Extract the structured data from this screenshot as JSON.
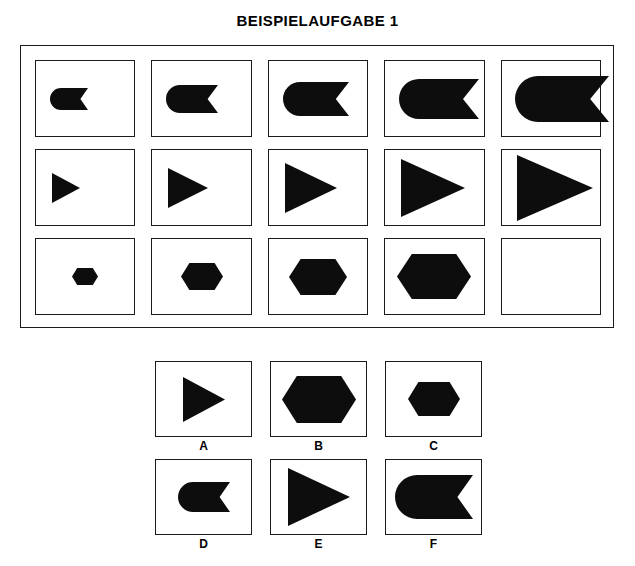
{
  "title": "BEISPIELAUFGABE 1",
  "colors": {
    "shape_fill": "#0d0d0d",
    "border": "#1a1a1a",
    "background": "#ffffff"
  },
  "chart_data": {
    "type": "table",
    "title": "BEISPIELAUFGABE 1",
    "grid": {
      "rows": 3,
      "columns": 5
    },
    "rules": [
      "Row 1: flag shape (rounded left end, V-notch on right), size increases left to right",
      "Row 2: right-pointing triangle, size increases left to right",
      "Row 3: horizontal hexagon, size increases left to right; column 5 is missing"
    ],
    "cells": [
      {
        "row": 1,
        "col": 1,
        "shape": "flag",
        "size_step": 1,
        "width": 38,
        "height": 22,
        "empty": false
      },
      {
        "row": 1,
        "col": 2,
        "shape": "flag",
        "size_step": 2,
        "width": 52,
        "height": 28,
        "empty": false
      },
      {
        "row": 1,
        "col": 3,
        "shape": "flag",
        "size_step": 3,
        "width": 66,
        "height": 34,
        "empty": false
      },
      {
        "row": 1,
        "col": 4,
        "shape": "flag",
        "size_step": 4,
        "width": 80,
        "height": 40,
        "empty": false
      },
      {
        "row": 1,
        "col": 5,
        "shape": "flag",
        "size_step": 5,
        "width": 94,
        "height": 46,
        "empty": false
      },
      {
        "row": 2,
        "col": 1,
        "shape": "triangle",
        "size_step": 1,
        "width": 28,
        "height": 30,
        "empty": false
      },
      {
        "row": 2,
        "col": 2,
        "shape": "triangle",
        "size_step": 2,
        "width": 40,
        "height": 40,
        "empty": false
      },
      {
        "row": 2,
        "col": 3,
        "shape": "triangle",
        "size_step": 3,
        "width": 52,
        "height": 50,
        "empty": false
      },
      {
        "row": 2,
        "col": 4,
        "shape": "triangle",
        "size_step": 4,
        "width": 64,
        "height": 58,
        "empty": false
      },
      {
        "row": 2,
        "col": 5,
        "shape": "triangle",
        "size_step": 5,
        "width": 76,
        "height": 66,
        "empty": false
      },
      {
        "row": 3,
        "col": 1,
        "shape": "hexagon",
        "size_step": 1,
        "width": 26,
        "height": 17,
        "empty": false
      },
      {
        "row": 3,
        "col": 2,
        "shape": "hexagon",
        "size_step": 2,
        "width": 42,
        "height": 27,
        "empty": false
      },
      {
        "row": 3,
        "col": 3,
        "shape": "hexagon",
        "size_step": 3,
        "width": 58,
        "height": 36,
        "empty": false
      },
      {
        "row": 3,
        "col": 4,
        "shape": "hexagon",
        "size_step": 4,
        "width": 74,
        "height": 45,
        "empty": false
      },
      {
        "row": 3,
        "col": 5,
        "shape": "none",
        "size_step": 0,
        "width": 0,
        "height": 0,
        "empty": true
      }
    ],
    "options": [
      {
        "label": "A",
        "shape": "triangle",
        "width": 42,
        "height": 45
      },
      {
        "label": "B",
        "shape": "hexagon",
        "width": 74,
        "height": 47
      },
      {
        "label": "C",
        "shape": "hexagon",
        "width": 52,
        "height": 34
      },
      {
        "label": "D",
        "shape": "flag",
        "width": 52,
        "height": 30
      },
      {
        "label": "E",
        "shape": "triangle",
        "width": 62,
        "height": 58
      },
      {
        "label": "F",
        "shape": "flag",
        "width": 78,
        "height": 44
      }
    ]
  }
}
